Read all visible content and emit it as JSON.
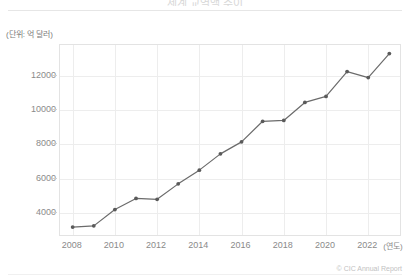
{
  "header": {
    "title_clipped": "세계 교역액 추이",
    "unit_label": "(단위: 억 달러)"
  },
  "footer": {
    "credit": "© CIC Annual Report"
  },
  "axis": {
    "x_unit_label": "(연도)"
  },
  "style": {
    "line_color": "#6b6b6b",
    "marker_color": "#5a5a5a",
    "grid_color": "#ededed",
    "axis_text_color": "#8a8a8a",
    "plot_border_color": "#e3e3e3"
  },
  "chart_data": {
    "type": "line",
    "title": "세계 교역액 추이",
    "xlabel": "(연도)",
    "ylabel": "(단위: 억 달러)",
    "xlim": [
      2007.4,
      2023.6
    ],
    "ylim": [
      2600,
      13800
    ],
    "grid": true,
    "legend": "none",
    "x": [
      2008,
      2009,
      2010,
      2011,
      2012,
      2013,
      2014,
      2015,
      2016,
      2017,
      2018,
      2019,
      2020,
      2021,
      2022,
      2023
    ],
    "xticks": [
      2008,
      2010,
      2012,
      2014,
      2016,
      2018,
      2020,
      2022
    ],
    "xtick_labels": [
      "2008",
      "2010",
      "2012",
      "2014",
      "2016",
      "2018",
      "2020",
      "2022"
    ],
    "yticks": [
      4000,
      6000,
      8000,
      10000,
      12000
    ],
    "ytick_labels": [
      "4000",
      "6000",
      "8000",
      "10000",
      "12000"
    ],
    "series": [
      {
        "name": "교역액",
        "values": [
          3180,
          3250,
          4200,
          4850,
          4800,
          5700,
          6500,
          7450,
          8150,
          9350,
          9400,
          10450,
          10800,
          12250,
          11900,
          13300
        ]
      }
    ]
  }
}
